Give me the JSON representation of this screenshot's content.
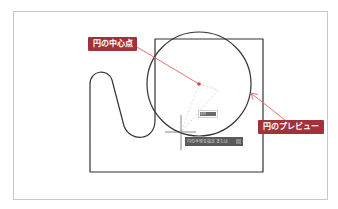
{
  "diagram": {
    "colors": {
      "callout_bg": "#a3313c",
      "callout_text": "#ffffff",
      "leader_line": "#e8707a",
      "center_point": "#e0404e",
      "geometry_stroke": "#333333",
      "frame_border": "#c8c8c8",
      "dashed_rubberband": "#c8c8c8",
      "tooltip_bg": "#5a5a5a"
    },
    "callouts": [
      {
        "id": "center",
        "label": "円の中心点"
      },
      {
        "id": "preview",
        "label": "円のプレビュー"
      }
    ],
    "dynamic_input": {
      "value": "半径"
    },
    "command_tooltip": {
      "text": "円の半径を指定 または"
    },
    "shapes": {
      "circle": {
        "cx": 199,
        "cy": 84,
        "r": 52
      },
      "rectangle": {
        "x1": 155,
        "y1": 39,
        "x2": 263,
        "y2": 172
      },
      "crosshair": {
        "x": 181,
        "y": 132
      }
    }
  }
}
